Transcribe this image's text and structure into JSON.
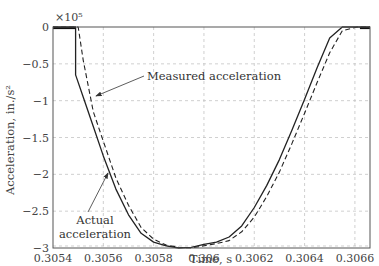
{
  "chart_data": {
    "type": "line",
    "title": "",
    "xlabel": "Time, s",
    "ylabel": "Acceleration, in./s²",
    "y_multiplier": "×10⁵",
    "xlim": [
      0.3054,
      0.30666
    ],
    "ylim": [
      -3,
      0
    ],
    "grid": true,
    "legend": "none (annotated with arrows)",
    "x_ticks": [
      0.3054,
      0.3056,
      0.3058,
      0.306,
      0.3062,
      0.3064,
      0.3066
    ],
    "x_tick_labels": [
      "0.3054",
      "0.3056",
      "0.3058",
      "0.306",
      "0.3062",
      "0.3064",
      "0.3066"
    ],
    "y_ticks": [
      0,
      -0.5,
      -1,
      -1.5,
      -2,
      -2.5,
      -3
    ],
    "y_tick_labels": [
      "0",
      "−0.5",
      "−1",
      "−1.5",
      "−2",
      "−2.5",
      "−3"
    ],
    "series": [
      {
        "name": "Actual acceleration",
        "style": "solid",
        "color": "#222222",
        "x": [
          0.3054,
          0.30549,
          0.30549,
          0.30552,
          0.30556,
          0.3056,
          0.30565,
          0.3057,
          0.30575,
          0.3058,
          0.30585,
          0.3059,
          0.30595,
          0.306,
          0.30605,
          0.3061,
          0.30615,
          0.3062,
          0.30625,
          0.3063,
          0.30635,
          0.3064,
          0.30645,
          0.3065,
          0.30655,
          0.30659,
          0.30662,
          0.30666
        ],
        "y": [
          0,
          0,
          -0.65,
          -0.95,
          -1.35,
          -1.75,
          -2.2,
          -2.55,
          -2.8,
          -2.92,
          -2.97,
          -3.0,
          -2.99,
          -2.95,
          -2.92,
          -2.85,
          -2.7,
          -2.45,
          -2.15,
          -1.8,
          -1.4,
          -0.98,
          -0.55,
          -0.15,
          0.0,
          0.0,
          0.0,
          0.0
        ]
      },
      {
        "name": "Measured acceleration",
        "style": "dashed",
        "color": "#222222",
        "x": [
          0.3054,
          0.3055,
          0.30552,
          0.30556,
          0.3056,
          0.30565,
          0.3057,
          0.30575,
          0.3058,
          0.30585,
          0.3059,
          0.30595,
          0.306,
          0.30605,
          0.3061,
          0.30615,
          0.3062,
          0.30625,
          0.3063,
          0.30635,
          0.3064,
          0.30645,
          0.3065,
          0.30655,
          0.30661,
          0.30666
        ],
        "y": [
          0,
          0,
          -0.45,
          -1.15,
          -1.55,
          -2.05,
          -2.42,
          -2.72,
          -2.88,
          -2.96,
          -2.99,
          -3.0,
          -2.97,
          -2.94,
          -2.9,
          -2.78,
          -2.58,
          -2.3,
          -1.97,
          -1.58,
          -1.17,
          -0.75,
          -0.35,
          -0.05,
          0.0,
          0.0
        ]
      }
    ],
    "annotations": [
      {
        "text": "Measured acceleration",
        "x": 0.30577,
        "y": -0.85,
        "arrow_to": [
          0.30557,
          -1.2
        ]
      },
      {
        "text_lines": [
          "Actual",
          "acceleration"
        ],
        "x": 0.30553,
        "y": -2.65,
        "arrow_to": [
          0.30559,
          -1.95
        ]
      }
    ]
  },
  "labels": {
    "xlabel": "Time, s",
    "ylabel": "Acceleration, in./s²",
    "multiplier": "×10⁵",
    "annot_measured": "Measured acceleration",
    "annot_actual_1": "Actual",
    "annot_actual_2": "acceleration"
  }
}
